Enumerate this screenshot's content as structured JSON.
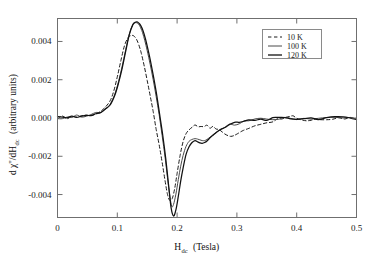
{
  "figure": {
    "background_color": "#ffffff",
    "frame_color": "#6f6f6f"
  },
  "axes": {
    "x_title_main": "H",
    "x_title_sub": "dc",
    "x_title_unit": "(Tesla)",
    "y_title": "d χ''/dH",
    "y_title_sub": "dc",
    "y_title_unit": "(arbitrary units)",
    "x_ticks": [
      "0",
      "0.1",
      "0.2",
      "0.3",
      "0.4",
      "0.5"
    ],
    "x_tick_values": [
      0,
      0.1,
      0.2,
      0.3,
      0.4,
      0.5
    ],
    "y_ticks": [
      "0.004",
      "0.002",
      "0.000",
      "-0.002",
      "-0.004"
    ],
    "y_tick_values": [
      0.004,
      0.002,
      0.0,
      -0.002,
      -0.004
    ]
  },
  "legend": {
    "position": "top-right",
    "entries": [
      {
        "label": "10 K",
        "style": "dashed",
        "color": "#1a1a1a",
        "width": 1.0
      },
      {
        "label": "100 K",
        "style": "solid",
        "color": "#4a4a4a",
        "width": 1.0
      },
      {
        "label": "120 K",
        "style": "solid",
        "color": "#111111",
        "width": 1.3
      }
    ]
  },
  "chart_data": {
    "type": "line",
    "title": "",
    "xlabel": "H_dc (Tesla)",
    "ylabel": "d χ''/dH_dc (arbitrary units)",
    "xlim": [
      0,
      0.5
    ],
    "ylim": [
      -0.0052,
      0.0052
    ],
    "grid": false,
    "legend_position": "top-right",
    "series": [
      {
        "name": "10 K",
        "style": "dashed",
        "color": "#1a1a1a",
        "peak": {
          "x": 0.125,
          "y": 0.00432
        },
        "trough": {
          "x": 0.188,
          "y": -0.00432
        },
        "x": [
          0.0,
          0.008,
          0.016,
          0.024,
          0.032,
          0.04,
          0.048,
          0.056,
          0.064,
          0.072,
          0.08,
          0.088,
          0.094,
          0.1,
          0.106,
          0.112,
          0.118,
          0.122,
          0.125,
          0.128,
          0.132,
          0.136,
          0.14,
          0.145,
          0.15,
          0.155,
          0.16,
          0.165,
          0.17,
          0.175,
          0.18,
          0.184,
          0.188,
          0.192,
          0.196,
          0.2,
          0.205,
          0.21,
          0.215,
          0.22,
          0.225,
          0.23,
          0.235,
          0.24,
          0.245,
          0.25,
          0.255,
          0.26,
          0.265,
          0.27,
          0.275,
          0.28,
          0.285,
          0.29,
          0.295,
          0.3,
          0.31,
          0.32,
          0.33,
          0.34,
          0.35,
          0.36,
          0.368,
          0.375,
          0.382,
          0.388,
          0.394,
          0.4,
          0.408,
          0.416,
          0.424,
          0.432,
          0.44,
          0.45,
          0.46,
          0.47,
          0.48,
          0.49,
          0.5
        ],
        "y": [
          2e-05,
          4e-05,
          3e-05,
          8e-05,
          6e-05,
          0.00012,
          0.00013,
          0.00018,
          0.00024,
          0.00034,
          0.0005,
          0.0009,
          0.0014,
          0.00215,
          0.003,
          0.00378,
          0.0042,
          0.0043,
          0.00432,
          0.00428,
          0.00412,
          0.00382,
          0.0034,
          0.00272,
          0.00196,
          0.00116,
          0.00034,
          -0.00052,
          -0.0014,
          -0.00232,
          -0.0033,
          -0.004,
          -0.00432,
          -0.0042,
          -0.00368,
          -0.0029,
          -0.00196,
          -0.00124,
          -0.00082,
          -0.00062,
          -0.0005,
          -0.00043,
          -0.00045,
          -0.0004,
          -0.00048,
          -0.00042,
          -0.0005,
          -0.00044,
          -0.00052,
          -0.0006,
          -0.00072,
          -0.00084,
          -0.00092,
          -0.00096,
          -0.00092,
          -0.00084,
          -0.00066,
          -0.0005,
          -0.00038,
          -0.00028,
          -0.0002,
          -0.00014,
          -8e-05,
          2e-05,
          0.0001,
          0.00014,
          0.0001,
          2e-05,
          -8e-05,
          -0.00012,
          -0.0001,
          -6e-05,
          -4e-05,
          -2e-05,
          -2e-05,
          0.0,
          0.0,
          0.0,
          0.0
        ]
      },
      {
        "name": "100 K",
        "style": "solid",
        "color": "#4a4a4a",
        "peak": {
          "x": 0.132,
          "y": 0.00498
        },
        "trough": {
          "x": 0.191,
          "y": -0.00462
        },
        "x": [
          0.0,
          0.008,
          0.016,
          0.024,
          0.032,
          0.04,
          0.048,
          0.056,
          0.064,
          0.072,
          0.08,
          0.088,
          0.096,
          0.102,
          0.108,
          0.114,
          0.12,
          0.125,
          0.129,
          0.132,
          0.135,
          0.138,
          0.142,
          0.146,
          0.15,
          0.155,
          0.16,
          0.165,
          0.17,
          0.175,
          0.18,
          0.185,
          0.188,
          0.191,
          0.194,
          0.198,
          0.202,
          0.206,
          0.21,
          0.215,
          0.22,
          0.225,
          0.23,
          0.234,
          0.238,
          0.242,
          0.246,
          0.25,
          0.255,
          0.26,
          0.266,
          0.272,
          0.28,
          0.288,
          0.296,
          0.304,
          0.312,
          0.32,
          0.33,
          0.34,
          0.35,
          0.36,
          0.37,
          0.38,
          0.39,
          0.4,
          0.412,
          0.424,
          0.436,
          0.45,
          0.464,
          0.478,
          0.49,
          0.5
        ],
        "y": [
          2e-05,
          3e-05,
          5e-05,
          6e-05,
          9e-05,
          0.00011,
          0.00014,
          0.00018,
          0.00023,
          0.00031,
          0.00044,
          0.00072,
          0.00126,
          0.0019,
          0.00268,
          0.00356,
          0.00438,
          0.00482,
          0.00496,
          0.00498,
          0.00492,
          0.00478,
          0.00448,
          0.00404,
          0.00352,
          0.0028,
          0.002,
          0.00112,
          0.00014,
          -0.00092,
          -0.00208,
          -0.0034,
          -0.0041,
          -0.00462,
          -0.00452,
          -0.00398,
          -0.00322,
          -0.00252,
          -0.00196,
          -0.00148,
          -0.00122,
          -0.00112,
          -0.00108,
          -0.0011,
          -0.00114,
          -0.00118,
          -0.00118,
          -0.00112,
          -0.001,
          -0.00088,
          -0.00074,
          -0.00062,
          -0.00048,
          -0.00038,
          -0.0003,
          -0.00024,
          -0.00019,
          -0.00015,
          -0.00011,
          -8e-05,
          -6e-05,
          -5e-05,
          -4e-05,
          -3e-05,
          -3e-05,
          -2e-05,
          -2e-05,
          -1e-05,
          -1e-05,
          -1e-05,
          0.0,
          0.0,
          0.0,
          0.0
        ]
      },
      {
        "name": "120 K",
        "style": "solid",
        "color": "#111111",
        "peak": {
          "x": 0.133,
          "y": 0.00502
        },
        "trough": {
          "x": 0.19,
          "y": -0.00512
        },
        "x": [
          0.0,
          0.008,
          0.016,
          0.024,
          0.032,
          0.04,
          0.048,
          0.056,
          0.064,
          0.072,
          0.08,
          0.088,
          0.096,
          0.102,
          0.108,
          0.114,
          0.12,
          0.126,
          0.13,
          0.133,
          0.136,
          0.139,
          0.143,
          0.147,
          0.151,
          0.156,
          0.161,
          0.166,
          0.171,
          0.176,
          0.181,
          0.186,
          0.19,
          0.194,
          0.198,
          0.202,
          0.206,
          0.21,
          0.215,
          0.22,
          0.225,
          0.23,
          0.234,
          0.238,
          0.242,
          0.246,
          0.25,
          0.255,
          0.26,
          0.266,
          0.272,
          0.28,
          0.288,
          0.296,
          0.304,
          0.312,
          0.32,
          0.33,
          0.34,
          0.35,
          0.36,
          0.37,
          0.38,
          0.39,
          0.4,
          0.412,
          0.424,
          0.436,
          0.45,
          0.464,
          0.478,
          0.49,
          0.5
        ],
        "y": [
          1e-05,
          3e-05,
          4e-05,
          6e-05,
          8e-05,
          0.0001,
          0.00013,
          0.00017,
          0.00022,
          0.0003,
          0.00042,
          0.00068,
          0.0012,
          0.00182,
          0.00258,
          0.00348,
          0.00434,
          0.00488,
          0.005,
          0.00502,
          0.00496,
          0.00484,
          0.00456,
          0.00414,
          0.00362,
          0.0029,
          0.00208,
          0.00118,
          0.00018,
          -0.0009,
          -0.00212,
          -0.00358,
          -0.0047,
          -0.00512,
          -0.0048,
          -0.0041,
          -0.0033,
          -0.00262,
          -0.0019,
          -0.0015,
          -0.00128,
          -0.00118,
          -0.00124,
          -0.0013,
          -0.00132,
          -0.00128,
          -0.0012,
          -0.00104,
          -0.0009,
          -0.00074,
          -0.00061,
          -0.00047,
          -0.00037,
          -0.00029,
          -0.00023,
          -0.00018,
          -0.00014,
          -0.0001,
          -8e-05,
          -6e-05,
          -5e-05,
          -4e-05,
          -3e-05,
          -2e-05,
          -2e-05,
          -1e-05,
          -1e-05,
          -1e-05,
          0.0,
          0.0,
          0.0,
          0.0,
          0.0
        ]
      }
    ]
  }
}
